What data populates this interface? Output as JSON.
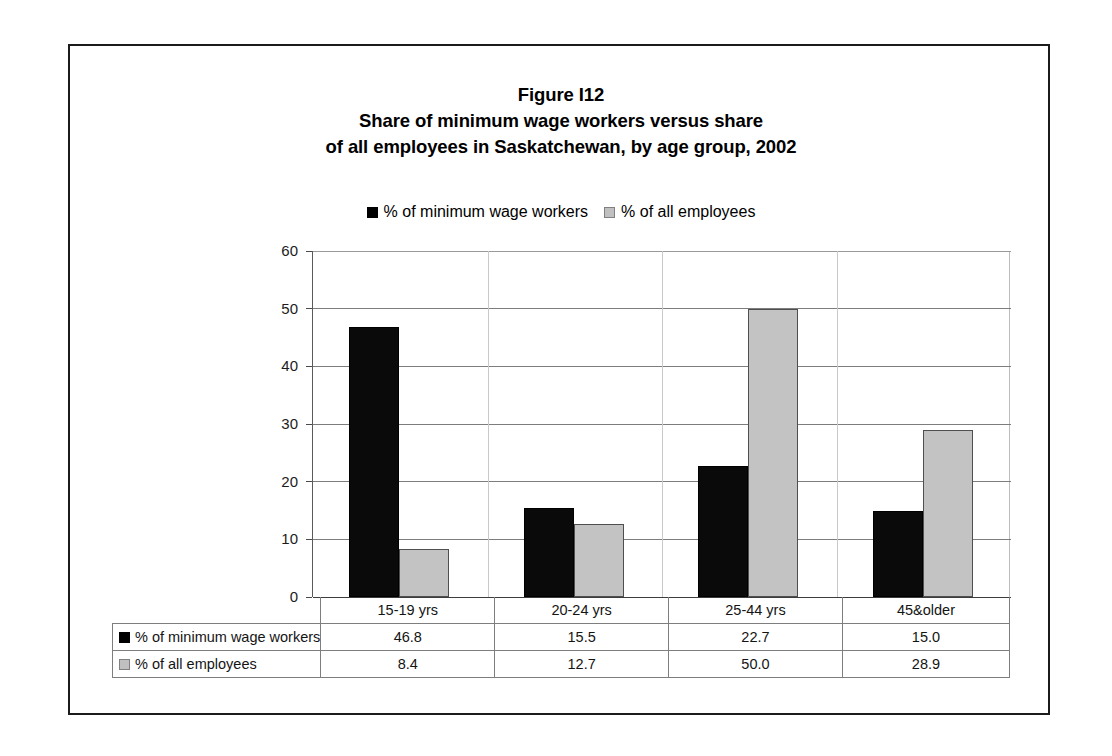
{
  "figure": {
    "title_lines": [
      "Figure I12",
      "Share of minimum wage workers versus share",
      "of all employees in Saskatchewan, by age group, 2002"
    ]
  },
  "legend": {
    "entries": [
      {
        "label": "% of minimum wage workers",
        "color": "#000000",
        "swatch": "filled-black-square"
      },
      {
        "label": "% of all employees",
        "color": "#c0c0c0",
        "swatch": "filled-gray-square"
      }
    ]
  },
  "axis": {
    "y_ticks": [
      "60",
      "50",
      "40",
      "30",
      "20",
      "10",
      "0"
    ]
  },
  "table": {
    "row_labels": [
      "% of minimum wage workers",
      "% of all employees"
    ],
    "column_headers": [
      "15-19 yrs",
      "20-24 yrs",
      "25-44 yrs",
      "45&older"
    ],
    "rows": [
      [
        "46.8",
        "15.5",
        "22.7",
        "15.0"
      ],
      [
        "8.4",
        "12.7",
        "50.0",
        "28.9"
      ]
    ]
  },
  "chart_data": {
    "type": "bar",
    "categories": [
      "15-19 yrs",
      "20-24 yrs",
      "25-44 yrs",
      "45&older"
    ],
    "series": [
      {
        "name": "% of minimum wage workers",
        "color": "#000000",
        "values": [
          46.8,
          15.5,
          22.7,
          15.0
        ]
      },
      {
        "name": "% of all employees",
        "color": "#c0c0c0",
        "values": [
          8.4,
          12.7,
          50.0,
          28.9
        ]
      }
    ],
    "xlabel": "",
    "ylabel": "",
    "ylim": [
      0,
      60
    ],
    "ytick_step": 10,
    "grid": true,
    "legend_position": "top-center",
    "data_table_shown": true
  }
}
